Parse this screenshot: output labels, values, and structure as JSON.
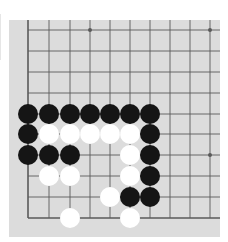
{
  "board": {
    "colors": {
      "page_background": "#ffffff",
      "board_background": "#dcdcdc",
      "grid_line": "#5a5a5a",
      "black_stone": "#151515",
      "white_stone": "#ffffff"
    },
    "grid": {
      "columns_x": [
        19,
        40,
        61,
        81,
        101,
        121,
        141,
        161,
        181,
        201
      ],
      "rows_y": [
        10,
        31,
        52,
        73,
        94,
        114,
        135,
        156,
        177,
        198
      ],
      "edges": {
        "left": true,
        "bottom": true,
        "top": false,
        "right": false
      }
    },
    "star_points": [
      {
        "col": 3,
        "row": 0
      },
      {
        "col": 9,
        "row": 0
      },
      {
        "col": 9,
        "row": 6
      }
    ],
    "stones": [
      {
        "color": "black",
        "col": 0,
        "row": 4
      },
      {
        "color": "black",
        "col": 1,
        "row": 4
      },
      {
        "color": "black",
        "col": 2,
        "row": 4
      },
      {
        "color": "black",
        "col": 3,
        "row": 4
      },
      {
        "color": "black",
        "col": 4,
        "row": 4
      },
      {
        "color": "black",
        "col": 5,
        "row": 4
      },
      {
        "color": "black",
        "col": 6,
        "row": 4
      },
      {
        "color": "black",
        "col": 0,
        "row": 5
      },
      {
        "color": "white",
        "col": 1,
        "row": 5
      },
      {
        "color": "white",
        "col": 2,
        "row": 5
      },
      {
        "color": "white",
        "col": 3,
        "row": 5
      },
      {
        "color": "white",
        "col": 4,
        "row": 5
      },
      {
        "color": "white",
        "col": 5,
        "row": 5
      },
      {
        "color": "black",
        "col": 6,
        "row": 5
      },
      {
        "color": "black",
        "col": 0,
        "row": 6
      },
      {
        "color": "black",
        "col": 1,
        "row": 6
      },
      {
        "color": "black",
        "col": 2,
        "row": 6
      },
      {
        "color": "white",
        "col": 5,
        "row": 6
      },
      {
        "color": "black",
        "col": 6,
        "row": 6
      },
      {
        "color": "white",
        "col": 1,
        "row": 7
      },
      {
        "color": "white",
        "col": 2,
        "row": 7
      },
      {
        "color": "white",
        "col": 5,
        "row": 7
      },
      {
        "color": "black",
        "col": 6,
        "row": 7
      },
      {
        "color": "white",
        "col": 4,
        "row": 8
      },
      {
        "color": "black",
        "col": 5,
        "row": 8
      },
      {
        "color": "black",
        "col": 6,
        "row": 8
      },
      {
        "color": "white",
        "col": 2,
        "row": 9
      },
      {
        "color": "white",
        "col": 5,
        "row": 9
      }
    ]
  }
}
